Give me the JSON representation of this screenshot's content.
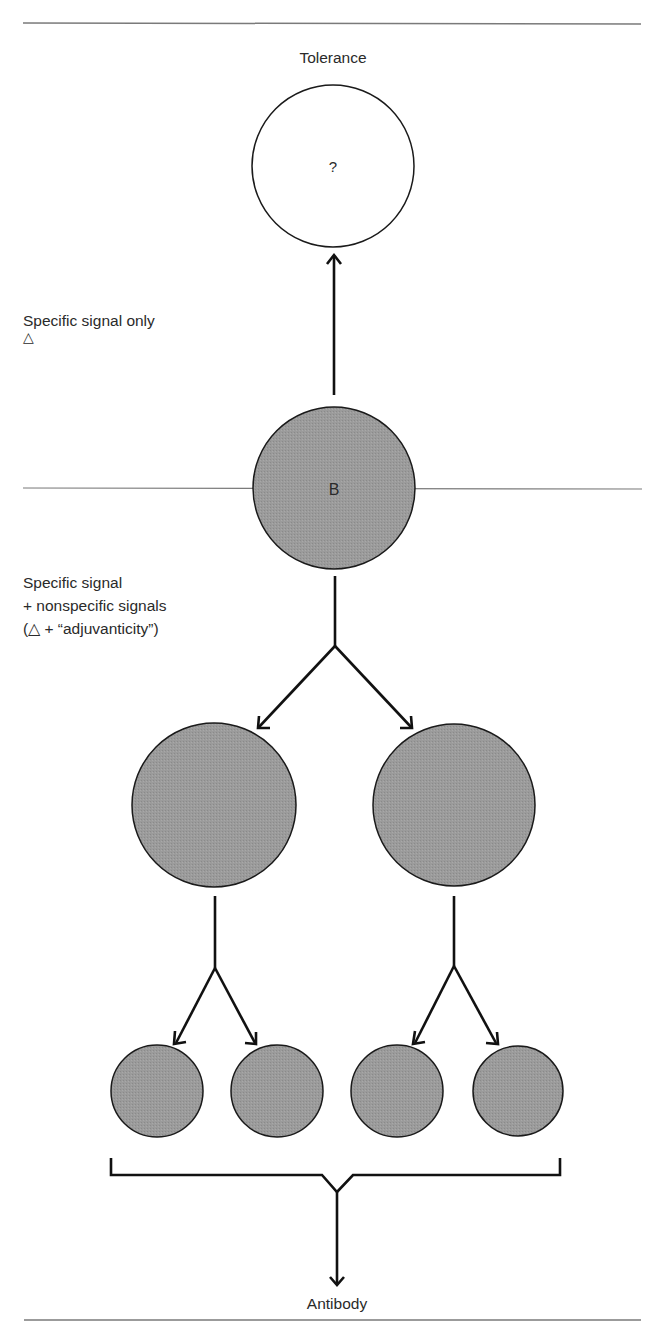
{
  "diagram": {
    "outcomes": {
      "top": "Tolerance",
      "bottom": "Antibody"
    },
    "pathways": {
      "tolerance": {
        "line1": "Specific signal only",
        "line2": "△"
      },
      "activation": {
        "line1": "Specific signal",
        "line2": "+ nonspecific signals",
        "line3": "(△ + “adjuvanticity”)"
      }
    },
    "cells": {
      "tolerant_cell_label": "?",
      "b_cell_label": "B"
    },
    "colors": {
      "cell_fill": "#9a9a9a",
      "cell_stroke": "#1a1a1a",
      "arrow": "#111111",
      "divider": "#7a7a7a",
      "background": "#ffffff"
    }
  }
}
